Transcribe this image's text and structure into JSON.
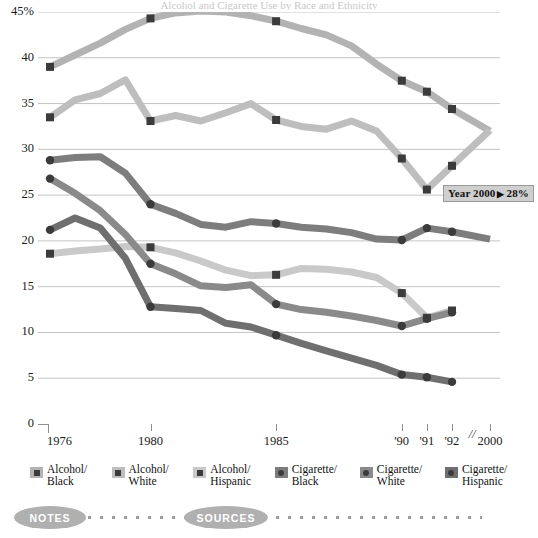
{
  "clipped_title": "Alcohol and Cigarette Use by Race and Ethnicity",
  "annotation": {
    "label": "Year 2000",
    "arrow": "▶",
    "value": "28%"
  },
  "footer": {
    "notes_label": "Notes",
    "sources_label": "Sources"
  },
  "colors": {
    "alcohol_black": "#b3b3b3",
    "alcohol_white": "#bebebe",
    "alcohol_hispanic": "#c9c9c9",
    "cigarette_black": "#7d7d7d",
    "cigarette_white": "#8a8a8a",
    "cigarette_hispanic": "#6f6f6f",
    "marker": "#3b3b3b",
    "gridline": "#c4c4c4",
    "axis": "#8e8e8e",
    "annotation_bg": "#cfcfcf",
    "pill_bg": "#b0b0b0"
  },
  "chart_data": {
    "type": "line",
    "title": "",
    "xlabel": "",
    "ylabel": "",
    "ylim": [
      0,
      45
    ],
    "yticks": [
      0,
      5,
      10,
      15,
      20,
      25,
      30,
      35,
      40,
      45
    ],
    "ytick_labels": [
      "0",
      "5",
      "10",
      "15",
      "20",
      "25",
      "30",
      "35",
      "40",
      "45%"
    ],
    "grid": true,
    "legend_position": "bottom",
    "axis_break_before_last_tick": true,
    "x": [
      1976,
      1977,
      1978,
      1979,
      1980,
      1981,
      1982,
      1983,
      1984,
      1985,
      1986,
      1987,
      1988,
      1989,
      1990,
      1991,
      1992,
      2000
    ],
    "xtick_values": [
      1976,
      1980,
      1985,
      1990,
      1991,
      1992,
      2000
    ],
    "xtick_labels": [
      "1976",
      "1980",
      "1985",
      "'90",
      "'91",
      "'92",
      "2000"
    ],
    "marked_points": [
      1976,
      1980,
      1985,
      1990,
      1991,
      1992
    ],
    "series": [
      {
        "name": "Alcohol/Black",
        "marker": "square",
        "color": "#b3b3b3",
        "values": [
          39.0,
          40.3,
          41.6,
          43.1,
          44.3,
          44.9,
          45.1,
          45.0,
          44.6,
          44.0,
          43.2,
          42.5,
          41.3,
          39.3,
          37.5,
          36.3,
          34.4,
          32.0
        ]
      },
      {
        "name": "Alcohol/White",
        "marker": "square",
        "color": "#bebebe",
        "values": [
          33.5,
          35.4,
          36.1,
          37.6,
          33.1,
          33.7,
          33.1,
          34.0,
          35.0,
          33.2,
          32.5,
          32.2,
          33.1,
          32.0,
          29.0,
          25.6,
          28.2,
          32.1
        ]
      },
      {
        "name": "Alcohol/Hispanic",
        "marker": "square",
        "color": "#c9c9c9",
        "values": [
          18.6,
          18.9,
          19.1,
          19.4,
          19.3,
          18.7,
          17.8,
          16.8,
          16.2,
          16.3,
          17.0,
          16.9,
          16.6,
          16.0,
          14.3,
          11.6,
          12.4,
          null
        ]
      },
      {
        "name": "Cigarette/Black",
        "marker": "circle",
        "color": "#7d7d7d",
        "values": [
          28.8,
          29.1,
          29.2,
          27.4,
          24.0,
          23.0,
          21.8,
          21.5,
          22.1,
          21.9,
          21.5,
          21.3,
          20.9,
          20.2,
          20.1,
          21.4,
          21.0,
          20.2
        ]
      },
      {
        "name": "Cigarette/White",
        "marker": "circle",
        "color": "#8a8a8a",
        "values": [
          26.8,
          25.2,
          23.3,
          20.7,
          17.5,
          16.4,
          15.1,
          14.9,
          15.2,
          13.1,
          12.5,
          12.2,
          11.8,
          11.3,
          10.7,
          11.5,
          12.2,
          null
        ]
      },
      {
        "name": "Cigarette/Hispanic",
        "marker": "circle",
        "color": "#6f6f6f",
        "values": [
          21.2,
          22.5,
          21.4,
          18.1,
          12.8,
          12.6,
          12.4,
          11.0,
          10.6,
          9.7,
          8.8,
          8.0,
          7.2,
          6.4,
          5.4,
          5.1,
          4.6,
          null
        ]
      }
    ]
  },
  "legend": {
    "items": [
      {
        "label_line1": "Alcohol/",
        "label_line2": "Black",
        "marker": "square"
      },
      {
        "label_line1": "Alcohol/",
        "label_line2": "White",
        "marker": "square"
      },
      {
        "label_line1": "Alcohol/",
        "label_line2": "Hispanic",
        "marker": "square"
      },
      {
        "label_line1": "Cigarette/",
        "label_line2": "Black",
        "marker": "circle"
      },
      {
        "label_line1": "Cigarette/",
        "label_line2": "White",
        "marker": "circle"
      },
      {
        "label_line1": "Cigarette/",
        "label_line2": "Hispanic",
        "marker": "circle"
      }
    ]
  }
}
